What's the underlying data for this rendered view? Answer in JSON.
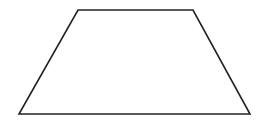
{
  "diagram": {
    "shape": "trapezoid",
    "stroke_color": "#222222",
    "fill_color": "#ffffff",
    "stroke_width": 1.6,
    "vertices": [
      {
        "name": "top-left",
        "x": 78,
        "y": 10
      },
      {
        "name": "top-right",
        "x": 193,
        "y": 10
      },
      {
        "name": "bottom-right",
        "x": 250,
        "y": 114
      },
      {
        "name": "bottom-left",
        "x": 19,
        "y": 114
      }
    ]
  }
}
